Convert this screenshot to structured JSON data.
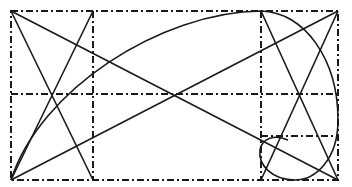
{
  "diagram": {
    "colors": {
      "line": "#1a1a1a",
      "background": "#ffffff"
    },
    "outer_rect": {
      "x1": 11,
      "y1": 11,
      "x2": 338,
      "y2": 180
    },
    "grid_verticals": [
      93,
      261
    ],
    "grid_horizontal_y": 94,
    "small_box": {
      "x1": 261,
      "y1": 136,
      "x2": 338,
      "y2": 180
    },
    "diagonals": [
      {
        "from": [
          11,
          11
        ],
        "to": [
          93,
          180
        ]
      },
      {
        "from": [
          93,
          11
        ],
        "to": [
          11,
          180
        ]
      },
      {
        "from": [
          11,
          11
        ],
        "to": [
          338,
          180
        ]
      },
      {
        "from": [
          11,
          180
        ],
        "to": [
          338,
          11
        ]
      },
      {
        "from": [
          261,
          11
        ],
        "to": [
          338,
          180
        ]
      },
      {
        "from": [
          338,
          11
        ],
        "to": [
          261,
          180
        ]
      }
    ],
    "spiral": "golden spiral arc from bottom-left corner to top, down right side, curling into bottom-right square"
  }
}
